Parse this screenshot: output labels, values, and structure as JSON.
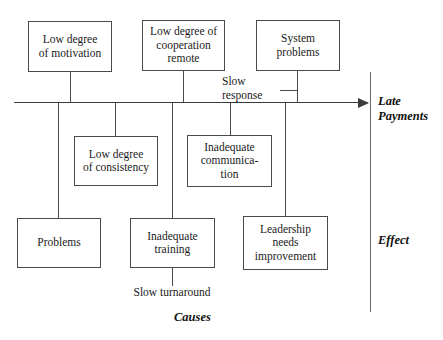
{
  "diagram": {
    "type": "fishbone-cause-and-effect",
    "effect_label": "Late\nPayments",
    "effect_label_line1": "Late",
    "effect_label_line2": "Payments",
    "causes_axis_label": "Causes",
    "effect_axis_label": "Effect",
    "spine_color": "#3a3a3a",
    "box_border_color": "#4a4a4a",
    "background_color": "#ffffff"
  },
  "causes_above": [
    {
      "id": "low-degree-of-motivation",
      "line1": "Low degree",
      "line2": "of motivation"
    },
    {
      "id": "low-degree-of-cooperation-remote",
      "line1": "Low degree of",
      "line2": "cooperation",
      "line3": "remote"
    },
    {
      "id": "system-problems",
      "line1": "System",
      "line2": "problems"
    }
  ],
  "sub_cause_above": {
    "id": "slow-response",
    "line1": "Slow",
    "line2": "response"
  },
  "causes_below": [
    {
      "id": "low-degree-of-consistency",
      "line1": "Low degree",
      "line2": "of consistency"
    },
    {
      "id": "inadequate-communication",
      "line1": "Inadequate",
      "line2": "communica-",
      "line3": "tion"
    },
    {
      "id": "problems",
      "line1": "Problems"
    },
    {
      "id": "inadequate-training",
      "line1": "Inadequate",
      "line2": "training"
    },
    {
      "id": "leadership-needs-improvement",
      "line1": "Leadership",
      "line2": "needs",
      "line3": "improvement"
    }
  ],
  "sub_cause_below": {
    "id": "slow-turnaround",
    "text": "Slow turnaround"
  }
}
